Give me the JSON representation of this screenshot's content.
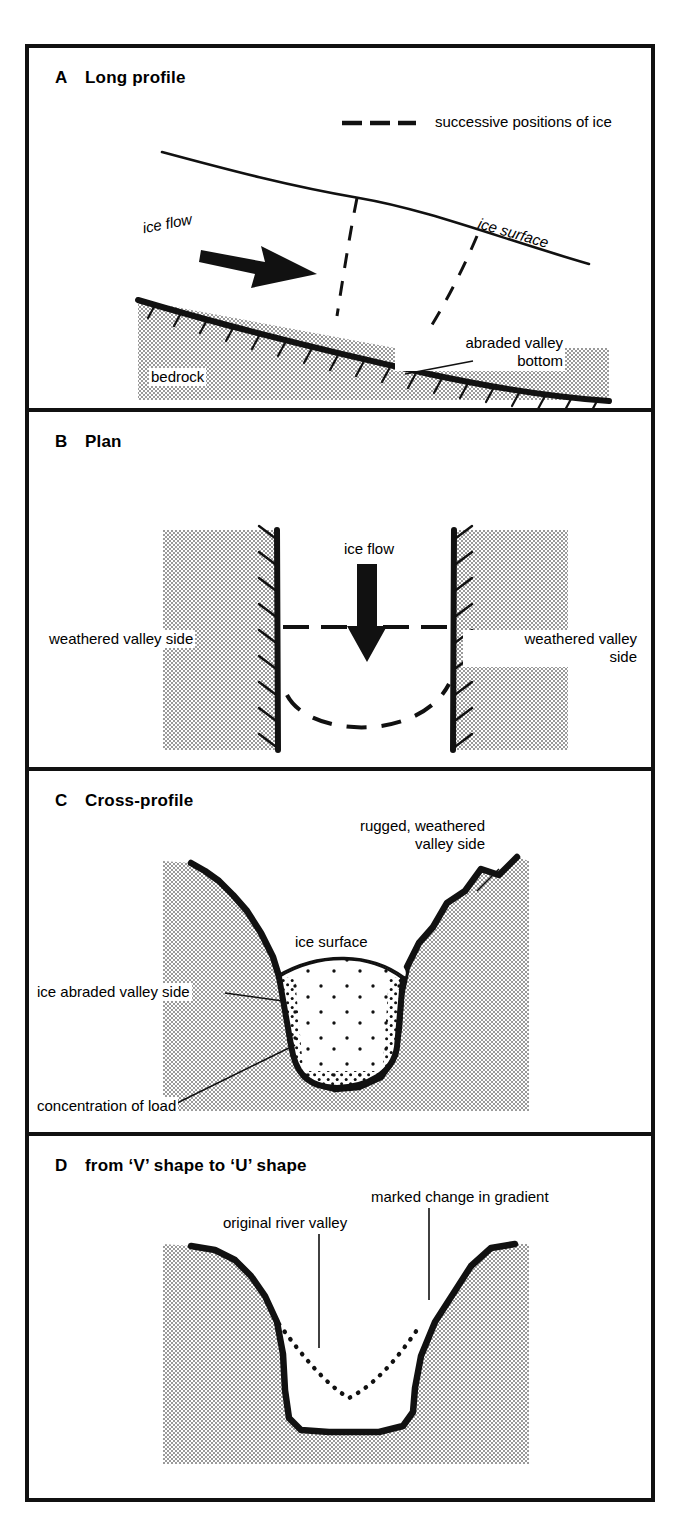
{
  "figure": {
    "kind": "glacial-erosion-diagram",
    "panel_count": 4,
    "colors": {
      "ink": "#111111",
      "paper": "#ffffff",
      "stipple_gray": "#9a9a9a"
    }
  },
  "panels": [
    {
      "letter": "A",
      "title": "Long profile",
      "legend": {
        "label": "successive positions of ice",
        "style": "dashed-line"
      },
      "labels": [
        {
          "name": "ice-flow",
          "text": "ice flow"
        },
        {
          "name": "ice-surface",
          "text": "ice surface"
        },
        {
          "name": "abraded-valley-bottom",
          "line1": "abraded valley",
          "line2": "bottom"
        },
        {
          "name": "bedrock",
          "text": "bedrock"
        }
      ]
    },
    {
      "letter": "B",
      "title": "Plan",
      "labels": [
        {
          "name": "ice-flow",
          "text": "ice flow"
        },
        {
          "name": "weathered-valley-side-left",
          "text": "weathered valley side"
        },
        {
          "name": "weathered-valley-side-right",
          "line1": "weathered valley",
          "line2": "side"
        }
      ]
    },
    {
      "letter": "C",
      "title": "Cross-profile",
      "labels": [
        {
          "name": "rugged-weathered-valley-side",
          "line1": "rugged, weathered",
          "line2": "valley side"
        },
        {
          "name": "ice-surface",
          "text": "ice surface"
        },
        {
          "name": "ice-abraded-valley-side",
          "text": "ice abraded valley side"
        },
        {
          "name": "concentration-of-load",
          "text": "concentration of load"
        }
      ]
    },
    {
      "letter": "D",
      "title": "from ‘V’ shape to ‘U’ shape",
      "labels": [
        {
          "name": "marked-change-in-gradient",
          "text": "marked change in gradient"
        },
        {
          "name": "original-river-valley",
          "text": "original river valley"
        }
      ]
    }
  ]
}
